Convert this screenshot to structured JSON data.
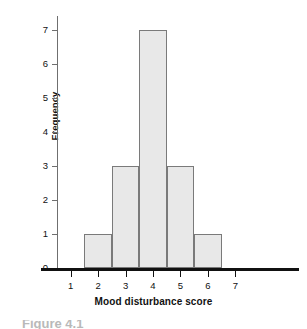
{
  "chart_data": {
    "type": "bar",
    "title": "",
    "xlabel": "Mood disturbance score",
    "ylabel": "Frequency",
    "categories": [
      1,
      2,
      3,
      4,
      5,
      6,
      7
    ],
    "values": [
      0,
      1,
      3,
      7,
      3,
      1,
      0
    ],
    "xtick_labels": [
      "1",
      "2",
      "3",
      "4",
      "5",
      "6",
      "7"
    ],
    "ytick_labels": [
      "0",
      "1",
      "2",
      "3",
      "4",
      "5",
      "6",
      "7"
    ],
    "xlim": [
      0.5,
      7.5
    ],
    "ylim": [
      0,
      7
    ],
    "grid": false,
    "legend": null,
    "bar_fill_color": "#e8e8e8",
    "bar_border_color": "#7a7a7a",
    "axis_color": "#111111",
    "bars": [
      {
        "center": 2,
        "frequency": 1
      },
      {
        "center": 3,
        "frequency": 3
      },
      {
        "center": 4,
        "frequency": 7
      },
      {
        "center": 5,
        "frequency": 3
      },
      {
        "center": 6,
        "frequency": 1
      }
    ]
  },
  "caption": {
    "text": "Figure 4.1"
  }
}
